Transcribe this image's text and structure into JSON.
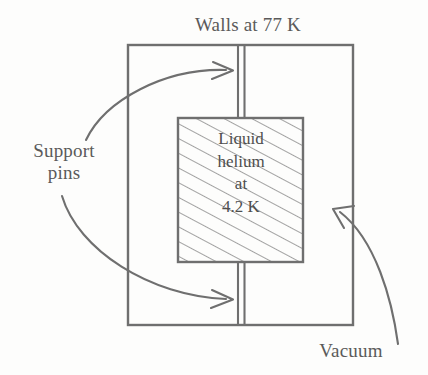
{
  "figure": {
    "type": "cross-section-schematic",
    "background_color": "#fdfdfc",
    "line_color": "#6b6b6b",
    "text_color": "#5a5a5a",
    "labels": {
      "walls": "Walls at 77 K",
      "support_pins": "Support\npins",
      "vacuum": "Vacuum"
    },
    "inner_vessel": {
      "contents": "Liquid\nhelium\nat\n4.2 K",
      "lines": [
        "Liquid",
        "helium",
        "at",
        "4.2 K"
      ],
      "fill": "hatched-diagonal"
    },
    "temperatures": {
      "wall_temperature": "77 K",
      "liquid_helium_temperature": "4.2 K"
    },
    "geometry": {
      "outer_box": {
        "x": 128,
        "y": 45,
        "width": 225,
        "height": 280
      },
      "inner_box": {
        "x": 178,
        "y": 118,
        "width": 125,
        "height": 144
      },
      "support_pin_x": [
        238,
        244
      ],
      "hatch_angle_deg": 62,
      "hatch_spacing_px": 13
    }
  }
}
